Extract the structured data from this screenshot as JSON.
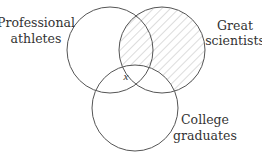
{
  "diagram": {
    "type": "venn",
    "sets": [
      {
        "id": "athletes",
        "label_lines": [
          "Professional",
          "athletes"
        ]
      },
      {
        "id": "scientists",
        "label_lines": [
          "Great",
          "scientists"
        ]
      },
      {
        "id": "graduates",
        "label_lines": [
          "College",
          "graduates"
        ]
      }
    ],
    "shaded_region": "Great scientists not College graduates (hatched)",
    "point_label": "x",
    "colors": {
      "stroke": "#555555",
      "hatch": "#9a9a9a",
      "text": "#333333",
      "background": "#ffffff"
    }
  }
}
